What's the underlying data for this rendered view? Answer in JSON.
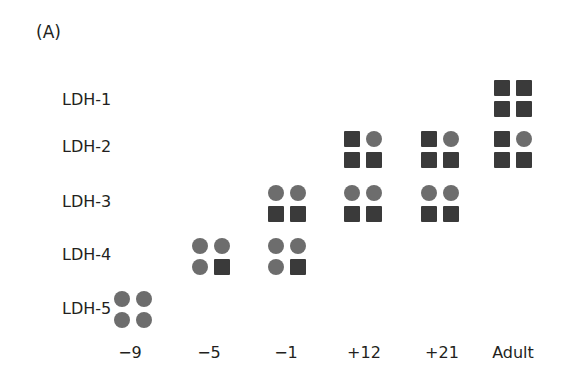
{
  "panel_label": "(A)",
  "rows": [
    "LDH-1",
    "LDH-2",
    "LDH-3",
    "LDH-4",
    "LDH-5"
  ],
  "columns": [
    "−9",
    "−5",
    "−1",
    "+12",
    "+21",
    "Adult"
  ],
  "legend_meaning": {
    "H": "dark square subunit",
    "M": "gray circle subunit"
  },
  "colors": {
    "square": "#3a3a3a",
    "circle": "#6d6d6d",
    "text": "#231f20"
  },
  "chart_data": {
    "type": "table",
    "title": "(A)",
    "rows": [
      "LDH-1",
      "LDH-2",
      "LDH-3",
      "LDH-4",
      "LDH-5"
    ],
    "columns": [
      "-9",
      "-5",
      "-1",
      "+12",
      "+21",
      "Adult"
    ],
    "cells": [
      {
        "column": "-9",
        "row": "LDH-5",
        "subunits": [
          "M",
          "M",
          "M",
          "M"
        ]
      },
      {
        "column": "-5",
        "row": "LDH-4",
        "subunits": [
          "M",
          "M",
          "M",
          "H"
        ]
      },
      {
        "column": "-1",
        "row": "LDH-3",
        "subunits": [
          "M",
          "M",
          "H",
          "H"
        ]
      },
      {
        "column": "-1",
        "row": "LDH-4",
        "subunits": [
          "M",
          "M",
          "M",
          "H"
        ]
      },
      {
        "column": "+12",
        "row": "LDH-2",
        "subunits": [
          "H",
          "M",
          "H",
          "H"
        ]
      },
      {
        "column": "+12",
        "row": "LDH-3",
        "subunits": [
          "M",
          "M",
          "H",
          "H"
        ]
      },
      {
        "column": "+21",
        "row": "LDH-2",
        "subunits": [
          "H",
          "M",
          "H",
          "H"
        ]
      },
      {
        "column": "+21",
        "row": "LDH-3",
        "subunits": [
          "M",
          "M",
          "H",
          "H"
        ]
      },
      {
        "column": "Adult",
        "row": "LDH-1",
        "subunits": [
          "H",
          "H",
          "H",
          "H"
        ]
      },
      {
        "column": "Adult",
        "row": "LDH-2",
        "subunits": [
          "H",
          "M",
          "H",
          "H"
        ]
      }
    ]
  }
}
